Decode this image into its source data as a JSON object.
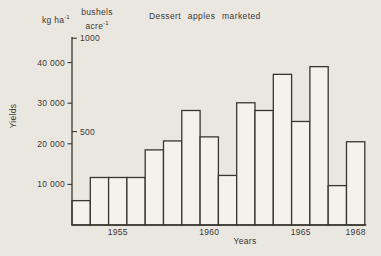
{
  "figure": {
    "title": "Dessert apples marketed",
    "y_axis_title": "Yields",
    "x_axis_title": "Years",
    "left_unit": {
      "base": "kg ha",
      "exp": "-1"
    },
    "right_unit": {
      "line1": "bushels",
      "line2_base": "acre",
      "line2_exp": "-1"
    }
  },
  "chart_data": {
    "type": "bar",
    "title": "Dessert apples marketed",
    "xlabel": "Years",
    "ylabel": "Yields",
    "y_unit_left": "kg ha^-1",
    "y_unit_right": "bushels acre^-1",
    "categories": [
      1953,
      1954,
      1955,
      1956,
      1957,
      1958,
      1959,
      1960,
      1961,
      1962,
      1963,
      1964,
      1965,
      1966,
      1967,
      1968
    ],
    "values": [
      6000,
      11700,
      11700,
      11700,
      18500,
      20700,
      28200,
      21700,
      12200,
      30100,
      28200,
      37100,
      25500,
      39000,
      9700,
      20500
    ],
    "left_ticks": [
      {
        "value": 10000,
        "label": "10 000"
      },
      {
        "value": 20000,
        "label": "20 000"
      },
      {
        "value": 30000,
        "label": "30 000"
      },
      {
        "value": 40000,
        "label": "40 000"
      }
    ],
    "right_ticks": [
      {
        "value": 500,
        "label": "500"
      },
      {
        "value": 1000,
        "label": "1000"
      }
    ],
    "kg_per_bushel_acre": 46,
    "x_tick_labels": [
      "1955",
      "1960",
      "1965",
      "1968"
    ],
    "x_start_year": 1953,
    "ylim": [
      0,
      46300
    ],
    "grid": false,
    "legend": "none",
    "bar_fill": "#f5f2ec",
    "line_color": "#39362f",
    "background": "#eae7e1"
  }
}
